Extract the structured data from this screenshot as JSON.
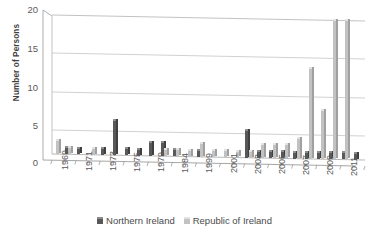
{
  "chart_data": {
    "type": "bar",
    "title": "",
    "xlabel": "",
    "ylabel": "Number of Persons",
    "ylim": [
      0,
      20
    ],
    "yticks": [
      0,
      5,
      10,
      15,
      20
    ],
    "grid": true,
    "legend_position": "bottom",
    "style": "3d-clustered-column",
    "categories": [
      "1969",
      "1970",
      "1971",
      "1972",
      "1973",
      "1974",
      "1975",
      "1976",
      "1979",
      "1980",
      "1984",
      "1985",
      "1999",
      "2000",
      "2001",
      "2002",
      "2003",
      "2004",
      "2005",
      "2006",
      "2007",
      "2008",
      "2009",
      "2010",
      "2011",
      "2012"
    ],
    "tick_labels": [
      "1969",
      "1971",
      "1973",
      "1975",
      "1979",
      "1984",
      "1999",
      "2001",
      "2003",
      "2005",
      "2007",
      "2009",
      "2011"
    ],
    "series": [
      {
        "name": "Northern Ireland",
        "color": "#585858",
        "values": [
          0,
          1,
          1,
          0,
          1,
          5,
          1,
          1,
          2,
          2,
          1,
          0,
          1,
          0,
          0,
          0,
          4,
          1,
          1,
          1,
          1,
          1,
          1,
          1,
          1,
          1
        ]
      },
      {
        "name": "Republic of Ireland",
        "color": "#c2c2c2",
        "values": [
          2,
          1,
          0,
          1,
          0,
          0,
          0,
          0,
          0,
          1,
          1,
          1,
          2,
          1,
          1,
          1,
          1,
          2,
          2,
          2,
          3,
          13,
          7,
          20,
          20,
          0
        ]
      }
    ]
  },
  "legend": {
    "items": [
      {
        "label": "Northern Ireland"
      },
      {
        "label": "Republic of Ireland"
      }
    ]
  },
  "axes": {
    "y_title": "Number of Persons",
    "y_tick_0": "0",
    "y_tick_1": "5",
    "y_tick_2": "10",
    "y_tick_3": "15",
    "y_tick_4": "20"
  }
}
